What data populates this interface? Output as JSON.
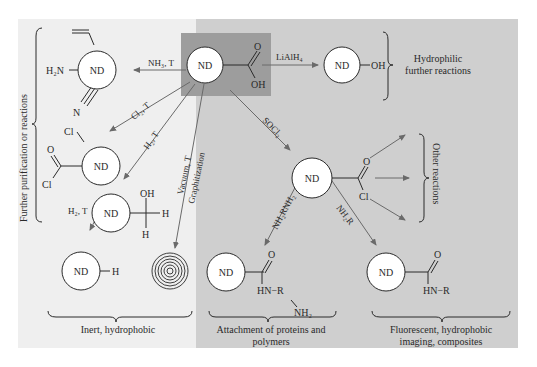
{
  "diagram": {
    "type": "reaction-scheme",
    "colors": {
      "left_panel": "#efefef",
      "right_panel": "#cfcfcf",
      "center_box": "#9d9d9d",
      "arrow": "#6a6a6a",
      "text": "#2a2a2a",
      "circle_fill": "#ffffff"
    },
    "core": "ND",
    "center": {
      "label": "ND",
      "group_top": "O",
      "group_bottom": "OH"
    },
    "reagents": {
      "nh3": "NH₃, T",
      "lialh4": "LiAlH₄",
      "cl2": "Cl₂, T",
      "h2": "H₂, T",
      "vacuum": "Vacuum, T",
      "graphitization": "Graphitization",
      "socl2": "SOCl₂",
      "h2_second": "H₂, T",
      "nh2rnh2": "NH₂RNH₂",
      "nh2r": "NH₂R"
    },
    "products": {
      "amine": {
        "label": "ND",
        "left": "H₂N",
        "bottom": "N"
      },
      "alcohol": {
        "label": "ND",
        "right": "OH"
      },
      "chloride": {
        "label": "ND",
        "top": "Cl",
        "acyl_o": "O",
        "acyl_cl": "Cl"
      },
      "hydroxyl_h": {
        "label": "ND",
        "top": "OH",
        "right": "H",
        "bottom": "H"
      },
      "hydride": {
        "label": "ND",
        "right": "H"
      },
      "acyl_chloride": {
        "label": "ND",
        "o": "O",
        "cl": "Cl"
      },
      "amide_diamine": {
        "label": "ND",
        "o": "O",
        "hn": "HN−R",
        "nh2": "NH₂"
      },
      "amide": {
        "label": "ND",
        "o": "O",
        "hn": "HN−R"
      }
    },
    "group_labels": {
      "further_purification": "Further purification or reactions",
      "hydrophilic_line1": "Hydrophilic",
      "hydrophilic_line2": "further reactions",
      "other_reactions": "Other reactions",
      "inert": "Inert, hydrophobic",
      "attachment_line1": "Attachment of proteins and",
      "attachment_line2": "polymers",
      "fluorescent_line1": "Fluorescent, hydrophobic",
      "fluorescent_line2": "imaging, composites"
    }
  }
}
